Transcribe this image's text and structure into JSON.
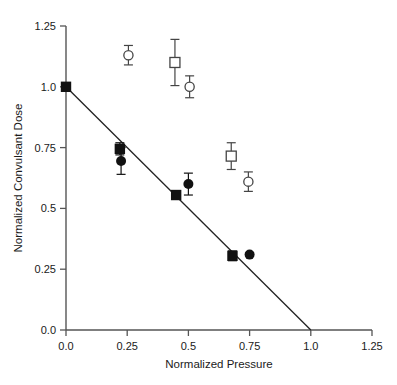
{
  "chart_data": {
    "type": "scatter",
    "title": "",
    "xlabel": "Normalized Pressure",
    "ylabel": "Normalized Convulsant Dose",
    "xlim": [
      0.0,
      1.25
    ],
    "ylim": [
      0.0,
      1.25
    ],
    "xticks": [
      0.0,
      0.25,
      0.5,
      0.75,
      1.0,
      1.25
    ],
    "yticks": [
      0.0,
      0.25,
      0.5,
      0.75,
      1.0,
      1.25
    ],
    "xtick_labels": [
      "0.0",
      "0.25",
      "0.5",
      "0.75",
      "1.0",
      "1.25"
    ],
    "ytick_labels": [
      "0.0",
      "0.25",
      "0.5",
      "0.75",
      "1.0",
      "1.25"
    ],
    "grid": false,
    "legend": "none",
    "series": [
      {
        "name": "filled-square",
        "marker": "filled-square",
        "color": "#111111",
        "points": [
          {
            "x": 0.0,
            "y": 1.0,
            "yerr": 0.0
          },
          {
            "x": 0.22,
            "y": 0.745,
            "yerr": 0.025
          },
          {
            "x": 0.45,
            "y": 0.555,
            "yerr": 0.0
          },
          {
            "x": 0.68,
            "y": 0.305,
            "yerr": 0.02
          }
        ]
      },
      {
        "name": "filled-circle",
        "marker": "filled-circle",
        "color": "#111111",
        "points": [
          {
            "x": 0.225,
            "y": 0.695,
            "yerr": 0.055
          },
          {
            "x": 0.5,
            "y": 0.6,
            "yerr": 0.045
          },
          {
            "x": 0.75,
            "y": 0.31,
            "yerr": 0.0
          }
        ]
      },
      {
        "name": "open-circle",
        "marker": "open-circle",
        "color": "#444444",
        "points": [
          {
            "x": 0.255,
            "y": 1.13,
            "yerr": 0.04
          },
          {
            "x": 0.505,
            "y": 1.0,
            "yerr": 0.045
          },
          {
            "x": 0.745,
            "y": 0.61,
            "yerr": 0.04
          }
        ]
      },
      {
        "name": "open-square",
        "marker": "open-square",
        "color": "#444444",
        "points": [
          {
            "x": 0.445,
            "y": 1.1,
            "yerr": 0.095
          },
          {
            "x": 0.675,
            "y": 0.715,
            "yerr": 0.055
          }
        ]
      }
    ],
    "fit_line": {
      "name": "reference-line",
      "x0": 0.0,
      "y0": 1.0,
      "x1": 1.0,
      "y1": 0.0,
      "color": "#222222"
    }
  },
  "axes": {
    "x_title": "Normalized Pressure",
    "y_title": "Normalized Convulsant Dose"
  }
}
